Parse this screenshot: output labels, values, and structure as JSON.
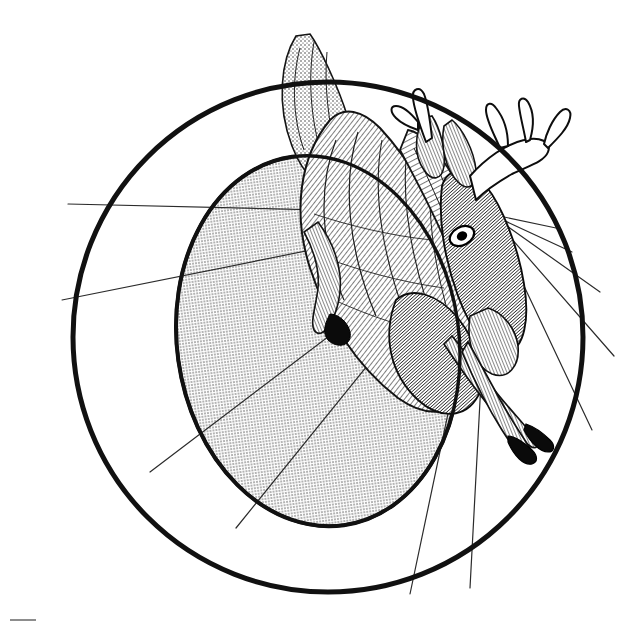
{
  "figure": {
    "style": "pen-and-ink engraving / hatched line art",
    "background_color": "#ffffff",
    "ink_color": "#111111",
    "shade_color": "#c6c6c6",
    "canvas": {
      "width": 640,
      "height": 624
    }
  },
  "geometry": {
    "outer_circle": {
      "name": "outer-circle",
      "cx": 328,
      "cy": 337,
      "r": 255,
      "stroke": "#111111",
      "stroke_width": 5,
      "fill": "none"
    },
    "shaded_ellipse": {
      "name": "shaded-ellipse",
      "cx": 318,
      "cy": 341,
      "rx": 141,
      "ry": 186,
      "rotation": -8,
      "stroke": "#111111",
      "stroke_width": 4,
      "fill": "#c6c6c6"
    },
    "radiating_lines": {
      "name": "radiating-lines",
      "origin_x": 490,
      "origin_y": 214,
      "stroke": "#2b2b2b",
      "stroke_width": 1.2,
      "endpoints": [
        {
          "x": 290,
          "y": 92
        },
        {
          "x": 68,
          "y": 204
        },
        {
          "x": 62,
          "y": 300
        },
        {
          "x": 150,
          "y": 472
        },
        {
          "x": 236,
          "y": 528
        },
        {
          "x": 410,
          "y": 594
        },
        {
          "x": 470,
          "y": 588
        },
        {
          "x": 592,
          "y": 430
        },
        {
          "x": 614,
          "y": 356
        },
        {
          "x": 600,
          "y": 292
        },
        {
          "x": 572,
          "y": 252
        },
        {
          "x": 556,
          "y": 228
        }
      ]
    }
  },
  "subject": {
    "name": "deer",
    "species_hint": "white-tailed buck",
    "orientation": "inverted / suspended",
    "parts": [
      "antlers",
      "head",
      "eye",
      "ears",
      "neck",
      "body",
      "hind-leg",
      "front-legs",
      "hooves",
      "tail"
    ]
  },
  "caption": {
    "text": "",
    "visible": false
  }
}
